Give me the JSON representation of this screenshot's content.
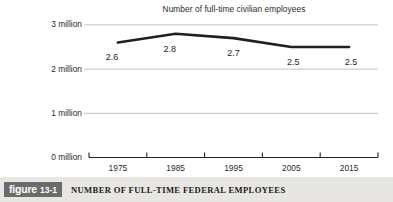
{
  "figure": {
    "badge_word": "figure",
    "badge_number": "13-1",
    "caption": "NUMBER OF FULL-TIME FEDERAL EMPLOYEES"
  },
  "colors": {
    "line": "#231f20",
    "gridline": "#b3b3b3",
    "axis": "#231f20",
    "text": "#2b2b2b",
    "caption_bar_bg": "#e8e6e3",
    "badge_bg": "#6b6b6b",
    "badge_text": "#ffffff",
    "background": "#ffffff"
  },
  "chart_data": {
    "type": "line",
    "title": "Number of full-time civilian employees",
    "xlabel": "",
    "ylabel": "",
    "categories": [
      "1975",
      "1985",
      "1995",
      "2005",
      "2015"
    ],
    "values": [
      2.6,
      2.8,
      2.7,
      2.5,
      2.5
    ],
    "point_labels": [
      "2.6",
      "2.8",
      "2.7",
      "2.5",
      "2.5"
    ],
    "ylim": [
      0,
      3
    ],
    "ytick_values": [
      0,
      1,
      2,
      3
    ],
    "ytick_labels": [
      "0 million",
      "1 million",
      "2 million",
      "3 million"
    ],
    "grid": true,
    "grid_axis": "y",
    "legend": false,
    "units": "millions of employees"
  }
}
